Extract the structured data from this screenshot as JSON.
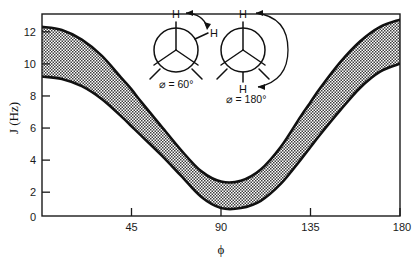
{
  "chart_data": {
    "type": "area",
    "title": "",
    "subtitle": "",
    "xlabel": "ϕ",
    "ylabel": "J (Hz)",
    "xlim": [
      0,
      180
    ],
    "ylim": [
      0,
      12.6
    ],
    "grid": false,
    "legend_position": "none",
    "x_ticks": [
      45,
      90,
      135,
      180
    ],
    "x_tick_labels": [
      "45",
      "90",
      "135",
      "180"
    ],
    "y_ticks": [
      0,
      2,
      4,
      6,
      8,
      10,
      12
    ],
    "y_tick_labels": [
      "0",
      "2",
      "4",
      "6",
      "8",
      "10",
      "12"
    ],
    "band_fill": "crosshatch-stipple",
    "band_fill_color": "#4a4a4a",
    "curve_color": "#111111",
    "x": [
      0,
      10,
      20,
      30,
      40,
      45,
      50,
      60,
      70,
      80,
      90,
      100,
      110,
      120,
      130,
      135,
      140,
      150,
      160,
      170,
      180
    ],
    "series": [
      {
        "name": "upper bound",
        "values": [
          11.8,
          11.6,
          11.0,
          10.0,
          8.6,
          7.9,
          7.1,
          5.6,
          4.1,
          2.8,
          2.15,
          2.2,
          2.9,
          4.3,
          6.2,
          7.1,
          8.0,
          9.6,
          10.9,
          11.8,
          12.25
        ]
      },
      {
        "name": "lower bound",
        "values": [
          8.7,
          8.55,
          8.1,
          7.3,
          6.2,
          5.6,
          5.0,
          3.8,
          2.5,
          1.2,
          0.5,
          0.5,
          0.95,
          2.0,
          3.5,
          4.3,
          5.1,
          6.6,
          8.0,
          9.0,
          9.5
        ]
      }
    ],
    "annotations": [
      {
        "name": "newman-60",
        "label": "⌀ = 60°",
        "top_atom": "H",
        "second_atom": "H",
        "arrow": "short-curved-clockwise"
      },
      {
        "name": "newman-180",
        "label": "⌀ = 180°",
        "top_atom": "H",
        "second_atom": "H",
        "arrow": "large-curved-clockwise"
      }
    ]
  },
  "axes": {
    "y_label": "J (Hz)",
    "x_label": "ϕ",
    "y_tick_labels": [
      "12",
      "10",
      "8",
      "6",
      "4",
      "2",
      "0"
    ],
    "x_tick_labels": [
      "45",
      "90",
      "135",
      "180"
    ]
  },
  "newman_left": {
    "label": "⌀ = 60°",
    "atom_top": "H",
    "atom_front": "H"
  },
  "newman_right": {
    "label": "⌀ = 180°",
    "atom_top": "H",
    "atom_bottom": "H"
  }
}
